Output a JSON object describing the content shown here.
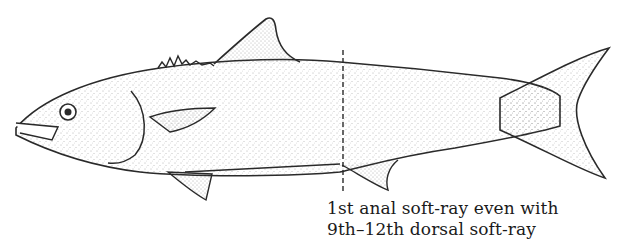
{
  "figure": {
    "annotation": {
      "lines": [
        "1st anal soft-ray even with",
        "9th–12th dorsal soft-ray"
      ]
    },
    "colors": {
      "outline": "#2a2a2a",
      "stipple": "#555555",
      "background": "#ffffff"
    }
  }
}
